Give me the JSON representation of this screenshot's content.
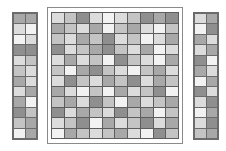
{
  "figure": {
    "background_color": "#ffffff",
    "border_color": "#6b6b6b",
    "grid_line_color": "#5d5d5d"
  },
  "palette": {
    "levels": [
      "#f2f2f2",
      "#dcdcdc",
      "#c4c4c4",
      "#a8a8a8",
      "#8f8f8f"
    ],
    "lightest": "#f2f2f2",
    "darkest": "#8f8f8f"
  },
  "chart_data": {
    "type": "heatmap",
    "title": "",
    "xlabel": "",
    "ylabel": "",
    "grid": true,
    "legend_position": "none",
    "colorscale": [
      "#f2f2f2",
      "#dcdcdc",
      "#c4c4c4",
      "#a8a8a8",
      "#8f8f8f"
    ],
    "panels": [
      {
        "name": "left-annotation-bar",
        "rows": 12,
        "cols": 2,
        "x": 12,
        "y": 12,
        "width": 26,
        "height": 128,
        "values": [
          [
            3,
            3
          ],
          [
            1,
            0
          ],
          [
            0,
            1
          ],
          [
            4,
            4
          ],
          [
            1,
            2
          ],
          [
            2,
            1
          ],
          [
            3,
            1
          ],
          [
            1,
            3
          ],
          [
            3,
            0
          ],
          [
            4,
            2
          ],
          [
            2,
            3
          ],
          [
            0,
            3
          ]
        ]
      },
      {
        "name": "center-matrix",
        "rows": 12,
        "cols": 10,
        "x": 47,
        "y": 7,
        "width": 136,
        "height": 137,
        "values": [
          [
            1,
            2,
            4,
            1,
            0,
            1,
            2,
            4,
            3,
            4
          ],
          [
            3,
            2,
            1,
            3,
            0,
            2,
            3,
            1,
            0,
            2
          ],
          [
            2,
            1,
            3,
            2,
            4,
            1,
            2,
            0,
            1,
            3
          ],
          [
            4,
            1,
            2,
            3,
            4,
            2,
            1,
            3,
            0,
            1
          ],
          [
            1,
            3,
            1,
            2,
            0,
            4,
            2,
            1,
            0,
            3
          ],
          [
            2,
            0,
            3,
            4,
            2,
            1,
            0,
            2,
            3,
            1
          ],
          [
            1,
            4,
            2,
            1,
            3,
            2,
            4,
            1,
            3,
            2
          ],
          [
            3,
            1,
            0,
            2,
            0,
            3,
            1,
            2,
            4,
            0
          ],
          [
            2,
            3,
            1,
            4,
            2,
            0,
            3,
            1,
            2,
            3
          ],
          [
            4,
            1,
            3,
            2,
            1,
            4,
            2,
            3,
            0,
            2
          ],
          [
            1,
            2,
            4,
            0,
            3,
            1,
            2,
            4,
            1,
            3
          ],
          [
            0,
            3,
            2,
            1,
            2,
            3,
            1,
            0,
            4,
            2
          ]
        ]
      },
      {
        "name": "right-annotation-bar",
        "rows": 12,
        "cols": 2,
        "x": 193,
        "y": 12,
        "width": 26,
        "height": 128,
        "values": [
          [
            1,
            3
          ],
          [
            0,
            4
          ],
          [
            3,
            1
          ],
          [
            1,
            3
          ],
          [
            4,
            0
          ],
          [
            3,
            1
          ],
          [
            0,
            3
          ],
          [
            4,
            1
          ],
          [
            1,
            4
          ],
          [
            0,
            3
          ],
          [
            1,
            4
          ],
          [
            2,
            3
          ]
        ]
      }
    ]
  }
}
